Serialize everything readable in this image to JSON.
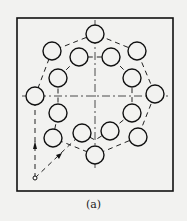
{
  "caption": "(a)",
  "diagram": {
    "frame": {
      "x": 17,
      "y": 18,
      "w": 156,
      "h": 173
    },
    "center": [
      95,
      96
    ],
    "hole_radius": 9,
    "outer_holes": [
      [
        95,
        34
      ],
      [
        137,
        51
      ],
      [
        155,
        94
      ],
      [
        138,
        137
      ],
      [
        95,
        155
      ],
      [
        53,
        138
      ],
      [
        35,
        96
      ],
      [
        52,
        51
      ]
    ],
    "inner_holes": [
      [
        79,
        57
      ],
      [
        111,
        57
      ],
      [
        132,
        78
      ],
      [
        132,
        113
      ],
      [
        110,
        131
      ],
      [
        82,
        133
      ],
      [
        58,
        113
      ],
      [
        58,
        78
      ]
    ],
    "start_point": [
      35,
      178
    ],
    "colors": {
      "line": "#111111",
      "bg": "#f2f2f0"
    }
  }
}
